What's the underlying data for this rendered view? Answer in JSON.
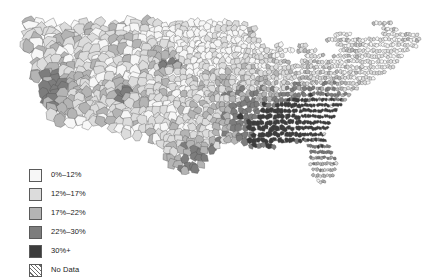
{
  "figure": {
    "background_color": "#ffffff",
    "map_region_label": "united-states-counties"
  },
  "legend": {
    "entries": [
      {
        "label": "0%–12%",
        "color": "#f7f7f7",
        "pattern": "solid"
      },
      {
        "label": "12%–17%",
        "color": "#dcdcdc",
        "pattern": "solid"
      },
      {
        "label": "17%–22%",
        "color": "#b4b4b4",
        "pattern": "solid"
      },
      {
        "label": "22%–30%",
        "color": "#7d7d7d",
        "pattern": "solid"
      },
      {
        "label": "30%+",
        "color": "#3c3c3c",
        "pattern": "solid"
      },
      {
        "label": "No Data",
        "color": "#ffffff",
        "pattern": "diagonal-hatch"
      }
    ]
  },
  "chart_data": {
    "type": "heatmap",
    "subtype": "choropleth-map",
    "title": "",
    "xlabel": "",
    "ylabel": "",
    "geography": "United States counties (contiguous 48 states)",
    "value_unit": "percent",
    "bins": [
      {
        "label": "0%–12%",
        "min": 0,
        "max": 12,
        "color": "#f7f7f7"
      },
      {
        "label": "12%–17%",
        "min": 12,
        "max": 17,
        "color": "#dcdcdc"
      },
      {
        "label": "17%–22%",
        "min": 17,
        "max": 22,
        "color": "#b4b4b4"
      },
      {
        "label": "22%–30%",
        "min": 22,
        "max": 30,
        "color": "#7d7d7d"
      },
      {
        "label": "30%+",
        "min": 30,
        "max": null,
        "color": "#3c3c3c"
      }
    ],
    "no_data_bin": {
      "label": "No Data",
      "color": "#ffffff",
      "pattern": "diagonal-hatch"
    },
    "boundary_color": "#4a4a4a",
    "legend_position": "bottom-left",
    "grid": false,
    "regional_summary": [
      {
        "region": "Southeast / Deep South",
        "dominant_bin": "22%–30%",
        "note": "Darkest broad cluster; many counties in 30%+ band"
      },
      {
        "region": "Appalachia",
        "dominant_bin": "22%–30%",
        "note": "Continuous dark belt through KY, WV, TN"
      },
      {
        "region": "Lower Mississippi Valley",
        "dominant_bin": "30%+",
        "note": "Highest concentration of top-bin counties"
      },
      {
        "region": "Great Plains",
        "dominant_bin": "12%–17%",
        "note": "Large, light counties with scattered mid tones"
      },
      {
        "region": "Upper Midwest",
        "dominant_bin": "12%–17%",
        "note": "Light to mid tones; dense small counties"
      },
      {
        "region": "Dakotas reservations",
        "dominant_bin": "30%+",
        "note": "Isolated very dark county cluster"
      },
      {
        "region": "Northeast / New England",
        "dominant_bin": "12%–17%",
        "note": "Mostly light with scattered mid tones"
      },
      {
        "region": "Mountain West",
        "dominant_bin": "17%–22%",
        "note": "Mixed; large counties, alternating light and mid"
      },
      {
        "region": "California coast",
        "dominant_bin": "22%–30%",
        "note": "Darker coastal and Central Valley counties"
      },
      {
        "region": "South Texas border",
        "dominant_bin": "30%+",
        "note": "Dark border counties along the Rio Grande"
      },
      {
        "region": "Florida peninsula",
        "dominant_bin": "17%–22%",
        "note": "Mid tones down the peninsula"
      }
    ],
    "bin_county_counts": [
      {
        "label": "0%–12%",
        "counties": 318
      },
      {
        "label": "12%–17%",
        "counties": 742
      },
      {
        "label": "17%–22%",
        "counties": 905
      },
      {
        "label": "22%–30%",
        "counties": 821
      },
      {
        "label": "30%+",
        "counties": 328
      }
    ],
    "total_counties": 3114
  }
}
